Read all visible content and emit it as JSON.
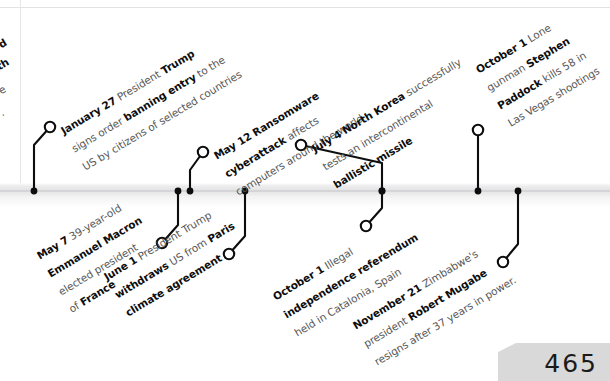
{
  "page": {
    "number": "465",
    "year_timeline_title": ""
  },
  "axis": {
    "color": "#e3e3e5",
    "line_color": "#d5d5d8"
  },
  "colors": {
    "ink": "#0d0d0d",
    "body_text": "#585858",
    "axis_band": "#e3e3e5",
    "page_tab": "#d9d9d9"
  },
  "clipped_fragments": [
    {
      "text": "d",
      "bold": true
    },
    {
      "text": "th",
      "bold": true
    },
    {
      "text": "e",
      "bold": false
    },
    {
      "text": ".",
      "bold": false
    }
  ],
  "events_above": [
    {
      "id": "jan-27-travel-ban",
      "date": "January 27",
      "lines": [
        [
          {
            "t": "January 27",
            "s": "date"
          },
          {
            "t": " President ",
            "s": "text"
          },
          {
            "t": "Trump",
            "s": "strong"
          }
        ],
        [
          {
            "t": "signs order ",
            "s": "text"
          },
          {
            "t": "banning entry",
            "s": "strong"
          },
          {
            "t": " to the",
            "s": "text"
          }
        ],
        [
          {
            "t": "US by citizens of selected countries",
            "s": "text"
          }
        ]
      ],
      "axis_x": 34,
      "node_x": 50,
      "node_y": 127
    },
    {
      "id": "may-12-ransomware",
      "date": "May 12",
      "lines": [
        [
          {
            "t": "May 12",
            "s": "date"
          },
          {
            "t": " ",
            "s": "text"
          },
          {
            "t": "Ransomware",
            "s": "strong"
          }
        ],
        [
          {
            "t": "cyberattack",
            "s": "strong"
          },
          {
            "t": " affects",
            "s": "text"
          }
        ],
        [
          {
            "t": "computers around the world",
            "s": "text"
          }
        ]
      ],
      "axis_x": 190,
      "node_x": 203,
      "node_y": 152
    },
    {
      "id": "jul-4-icbm",
      "date": "July 4",
      "lines": [
        [
          {
            "t": "July 4",
            "s": "date"
          },
          {
            "t": " ",
            "s": "text"
          },
          {
            "t": "North Korea",
            "s": "strong"
          },
          {
            "t": " successfully",
            "s": "text"
          }
        ],
        [
          {
            "t": "tests an intercontinental",
            "s": "text"
          }
        ],
        [
          {
            "t": "ballistic missile",
            "s": "strong"
          }
        ]
      ],
      "axis_x": 382,
      "node_x": 301,
      "node_y": 145
    },
    {
      "id": "oct-1-las-vegas",
      "date": "October 1",
      "lines": [
        [
          {
            "t": "October 1",
            "s": "date"
          },
          {
            "t": " Lone",
            "s": "text"
          }
        ],
        [
          {
            "t": "gunman ",
            "s": "text"
          },
          {
            "t": "Stephen",
            "s": "strong"
          }
        ],
        [
          {
            "t": "Paddock",
            "s": "strong"
          },
          {
            "t": " kills 58 in",
            "s": "text"
          }
        ],
        [
          {
            "t": "Las Vegas shootings",
            "s": "text"
          }
        ]
      ],
      "axis_x": 478,
      "node_x": 478,
      "node_y": 130
    }
  ],
  "events_below": [
    {
      "id": "may-7-macron",
      "date": "May 7",
      "lines": [
        [
          {
            "t": "May 7",
            "s": "date"
          },
          {
            "t": " 39-year-old",
            "s": "text"
          }
        ],
        [
          {
            "t": "Emmanuel Macron",
            "s": "strong"
          }
        ],
        [
          {
            "t": "elected president",
            "s": "text"
          }
        ],
        [
          {
            "t": "of ",
            "s": "text"
          },
          {
            "t": "France",
            "s": "strong"
          }
        ]
      ],
      "axis_x": 178,
      "node_x": 162,
      "node_y": 243
    },
    {
      "id": "jun-1-paris-withdrawal",
      "date": "June 1",
      "lines": [
        [
          {
            "t": "June 1",
            "s": "date"
          },
          {
            "t": "  President Trump",
            "s": "text"
          }
        ],
        [
          {
            "t": "withdraws",
            "s": "strong"
          },
          {
            "t": " US from ",
            "s": "text"
          },
          {
            "t": "Paris",
            "s": "strong"
          }
        ],
        [
          {
            "t": "climate agreement",
            "s": "strong"
          }
        ]
      ],
      "axis_x": 245,
      "node_x": 229,
      "node_y": 254
    },
    {
      "id": "oct-1-catalonia",
      "date": "October 1",
      "lines": [
        [
          {
            "t": "October 1",
            "s": "date"
          },
          {
            "t": " Illegal",
            "s": "text"
          }
        ],
        [
          {
            "t": "independence referendum",
            "s": "strong"
          }
        ],
        [
          {
            "t": "held in Catalonia, Spain",
            "s": "text"
          }
        ]
      ],
      "axis_x": 382,
      "node_x": 366,
      "node_y": 226
    },
    {
      "id": "nov-21-mugabe",
      "date": "November 21",
      "lines": [
        [
          {
            "t": "November 21",
            "s": "date"
          },
          {
            "t": " Zimbabwe's",
            "s": "text"
          }
        ],
        [
          {
            "t": "president ",
            "s": "text"
          },
          {
            "t": "Robert Mugabe",
            "s": "strong"
          }
        ],
        [
          {
            "t": "resigns after 37 years in power.",
            "s": "text"
          }
        ]
      ],
      "axis_x": 518,
      "node_x": 503,
      "node_y": 262
    }
  ]
}
